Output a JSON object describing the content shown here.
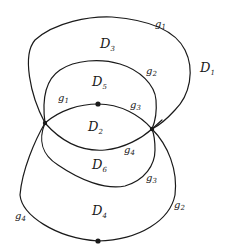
{
  "diagram": {
    "type": "planar-graph-regions",
    "vertices": [
      {
        "id": "left",
        "x": 45,
        "y": 123,
        "style": "cross"
      },
      {
        "id": "right",
        "x": 152,
        "y": 129,
        "style": "cross"
      },
      {
        "id": "top-dot",
        "x": 98,
        "y": 104,
        "style": "dot"
      },
      {
        "id": "bottom-dot",
        "x": 98,
        "y": 241,
        "style": "dot"
      }
    ],
    "regions": [
      {
        "id": "D1",
        "base": "D",
        "sub": "1",
        "x": 200,
        "y": 72
      },
      {
        "id": "D3",
        "base": "D",
        "sub": "3",
        "x": 100,
        "y": 48
      },
      {
        "id": "D5",
        "base": "D",
        "sub": "5",
        "x": 92,
        "y": 86
      },
      {
        "id": "D2",
        "base": "D",
        "sub": "2",
        "x": 88,
        "y": 131
      },
      {
        "id": "D6",
        "base": "D",
        "sub": "6",
        "x": 92,
        "y": 169
      },
      {
        "id": "D4",
        "base": "D",
        "sub": "4",
        "x": 92,
        "y": 215
      }
    ],
    "edge_labels": [
      {
        "id": "g1-outer",
        "base": "g",
        "sub": "1",
        "x": 155,
        "y": 27
      },
      {
        "id": "g2-middle",
        "base": "g",
        "sub": "2",
        "x": 146,
        "y": 74
      },
      {
        "id": "g1-inner",
        "base": "g",
        "sub": "1",
        "x": 58,
        "y": 101
      },
      {
        "id": "g3-inner",
        "base": "g",
        "sub": "3",
        "x": 130,
        "y": 108
      },
      {
        "id": "g4-inner",
        "base": "g",
        "sub": "4",
        "x": 124,
        "y": 153
      },
      {
        "id": "g3-lower",
        "base": "g",
        "sub": "3",
        "x": 146,
        "y": 181
      },
      {
        "id": "g2-outer",
        "base": "g",
        "sub": "2",
        "x": 174,
        "y": 208
      },
      {
        "id": "g4-outer",
        "base": "g",
        "sub": "4",
        "x": 15,
        "y": 219
      }
    ]
  }
}
